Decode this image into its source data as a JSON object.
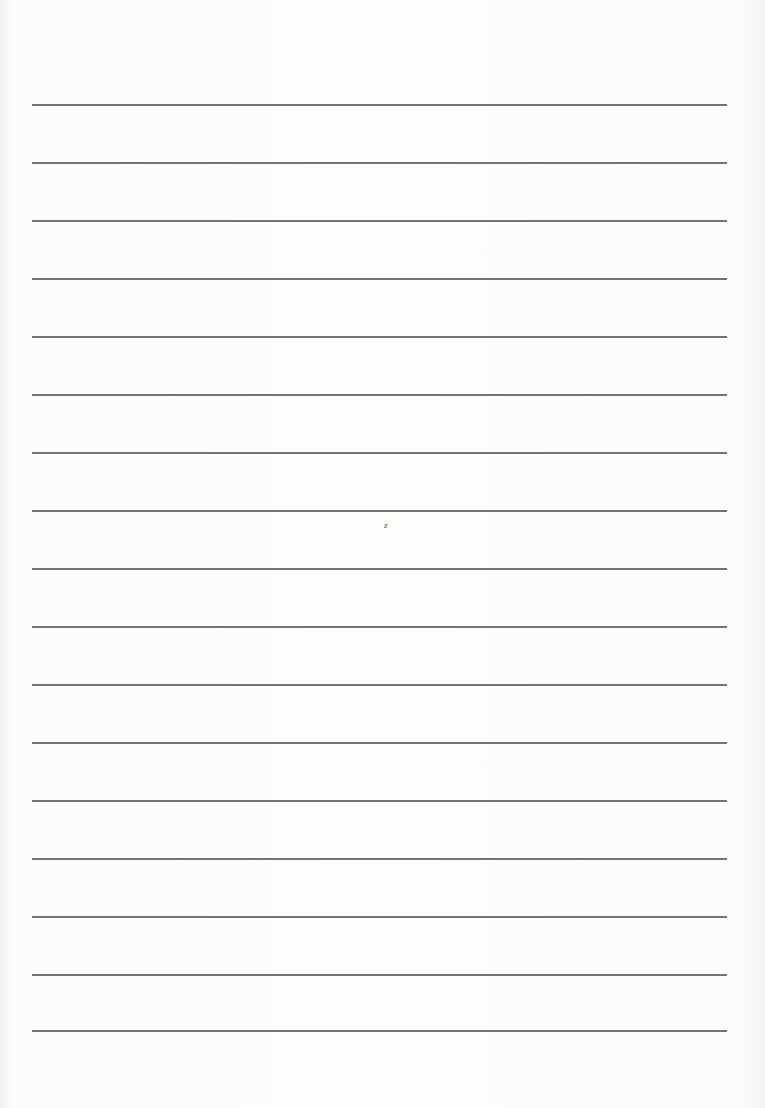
{
  "document": {
    "type": "lined-paper",
    "line_count": 17,
    "lines_y": [
      104,
      162,
      220,
      278,
      336,
      394,
      452,
      510,
      568,
      626,
      684,
      742,
      800,
      858,
      916,
      974,
      1030
    ],
    "line_color": "#5c5c5c",
    "paper_color": "#fbfbfa",
    "stray_mark": "z"
  }
}
